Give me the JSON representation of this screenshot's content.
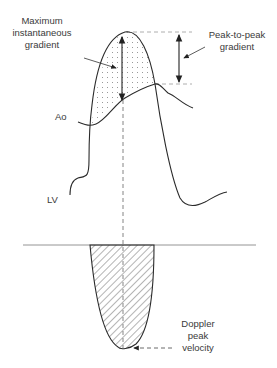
{
  "labels": {
    "max_gradient_line1": "Maximum",
    "max_gradient_line2": "instantaneous",
    "max_gradient_line3": "gradient",
    "p2p_line1": "Peak-to-peak",
    "p2p_line2": "gradient",
    "ao": "Ao",
    "lv": "LV",
    "doppler_line1": "Doppler",
    "doppler_line2": "peak",
    "doppler_line3": "velocity"
  },
  "colors": {
    "line": "#2a2a2a",
    "dashed": "#9a9a9a",
    "text": "#3a3a3a",
    "background": "#ffffff"
  }
}
